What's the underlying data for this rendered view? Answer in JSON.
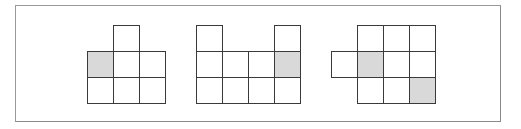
{
  "diagram": {
    "type": "grid-shape-figures",
    "cell_size_px": 26,
    "colors": {
      "frame_border": "#8a8a8a",
      "cell_border": "#3a3a3a",
      "cell_fill": "#ffffff",
      "shaded_fill": "#d9d9d9"
    },
    "figures": [
      {
        "id": "figure-1",
        "origin": [
          87,
          25
        ],
        "cells": [
          {
            "col": 1,
            "row": 0,
            "shaded": false
          },
          {
            "col": 0,
            "row": 1,
            "shaded": true
          },
          {
            "col": 1,
            "row": 1,
            "shaded": false
          },
          {
            "col": 2,
            "row": 1,
            "shaded": false
          },
          {
            "col": 0,
            "row": 2,
            "shaded": false
          },
          {
            "col": 1,
            "row": 2,
            "shaded": false
          },
          {
            "col": 2,
            "row": 2,
            "shaded": false
          }
        ]
      },
      {
        "id": "figure-2",
        "origin": [
          196,
          25
        ],
        "cells": [
          {
            "col": 0,
            "row": 0,
            "shaded": false
          },
          {
            "col": 3,
            "row": 0,
            "shaded": false
          },
          {
            "col": 0,
            "row": 1,
            "shaded": false
          },
          {
            "col": 1,
            "row": 1,
            "shaded": false
          },
          {
            "col": 2,
            "row": 1,
            "shaded": false
          },
          {
            "col": 3,
            "row": 1,
            "shaded": true
          },
          {
            "col": 0,
            "row": 2,
            "shaded": false
          },
          {
            "col": 1,
            "row": 2,
            "shaded": false
          },
          {
            "col": 2,
            "row": 2,
            "shaded": false
          },
          {
            "col": 3,
            "row": 2,
            "shaded": false
          }
        ]
      },
      {
        "id": "figure-3",
        "origin": [
          331,
          25
        ],
        "cells": [
          {
            "col": 1,
            "row": 0,
            "shaded": false
          },
          {
            "col": 2,
            "row": 0,
            "shaded": false
          },
          {
            "col": 3,
            "row": 0,
            "shaded": false
          },
          {
            "col": 0,
            "row": 1,
            "shaded": false
          },
          {
            "col": 1,
            "row": 1,
            "shaded": true
          },
          {
            "col": 2,
            "row": 1,
            "shaded": false
          },
          {
            "col": 3,
            "row": 1,
            "shaded": false
          },
          {
            "col": 1,
            "row": 2,
            "shaded": false
          },
          {
            "col": 2,
            "row": 2,
            "shaded": false
          },
          {
            "col": 3,
            "row": 2,
            "shaded": true
          }
        ]
      }
    ]
  }
}
